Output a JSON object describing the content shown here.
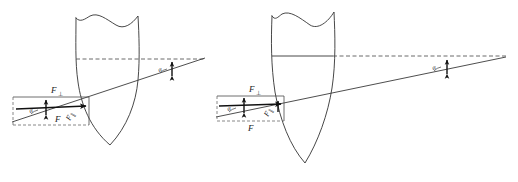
{
  "figure": {
    "background_color": "#ffffff",
    "stroke_color": "#333333",
    "accent_color": "#111111",
    "width": 518,
    "height": 182
  },
  "panels": [
    {
      "id": "left-panel",
      "name": "left-diagram",
      "shield": {
        "name": "shield-outline-left",
        "apex_x": 110,
        "apex_y": 145,
        "top_y": 14,
        "left_x": 76,
        "right_x": 138
      },
      "reference_line": {
        "name": "horizontal-dashed-axis",
        "y": 59,
        "x_start": 76,
        "x_end": 205,
        "style": "dashed"
      },
      "ray": {
        "name": "inclined-force-ray",
        "x_start": 12,
        "y_start": 122,
        "x_end": 205,
        "y_end": 58
      },
      "vanishing_point": {
        "x": 205,
        "y": 58
      },
      "force_box": {
        "name": "force-parallelogram",
        "x": 13,
        "y": 97,
        "width": 76,
        "height": 28
      },
      "labels": {
        "f_perp": "F",
        "f_perp_sub": "⊥",
        "f_main": "F",
        "f_parallel": "F",
        "f_parallel_sub": "∥",
        "angle_lower": "α",
        "angle_upper": "α"
      },
      "vectors": [
        {
          "name": "resultant-force-vector",
          "x1": 16,
          "y1": 108,
          "x2": 87,
          "y2": 105
        },
        {
          "name": "perpendicular-force-arrow",
          "x1": 46,
          "y1": 114,
          "x2": 46,
          "y2": 99
        }
      ],
      "angle_marker_upper": {
        "x": 166,
        "y": 71,
        "arrow_x": 172,
        "arrow_top": 62,
        "arrow_bottom": 76
      }
    },
    {
      "id": "right-panel",
      "name": "right-diagram",
      "shield": {
        "name": "shield-outline-right",
        "apex_x": 305,
        "apex_y": 163,
        "top_y": 12,
        "left_x": 272,
        "right_x": 333
      },
      "reference_line": {
        "name": "horizontal-dashed-axis",
        "y": 56,
        "x_start": 272,
        "x_end": 506,
        "style": "mixed"
      },
      "chord": {
        "name": "shield-chord-solid",
        "x_start": 272,
        "x_end": 333,
        "y": 56
      },
      "ray": {
        "name": "inclined-force-ray",
        "x_start": 216,
        "y_start": 117,
        "x_end": 506,
        "y_end": 57
      },
      "vanishing_point": {
        "x": 506,
        "y": 57
      },
      "force_box": {
        "name": "force-parallelogram",
        "x": 217,
        "y": 96,
        "width": 67,
        "height": 25
      },
      "labels": {
        "f_perp": "F",
        "f_perp_sub": "⊥",
        "f_main": "F",
        "f_parallel": "F",
        "f_parallel_sub": "∥",
        "angle_lower": "α",
        "angle_upper": "α"
      },
      "vectors": [
        {
          "name": "resultant-force-vector",
          "x1": 219,
          "y1": 105,
          "x2": 282,
          "y2": 103
        },
        {
          "name": "perpendicular-force-arrow",
          "x1": 244,
          "y1": 112,
          "x2": 244,
          "y2": 97
        }
      ],
      "angle_marker_upper": {
        "x": 440,
        "y": 69,
        "arrow_x": 447,
        "arrow_top": 60,
        "arrow_bottom": 74
      }
    }
  ]
}
